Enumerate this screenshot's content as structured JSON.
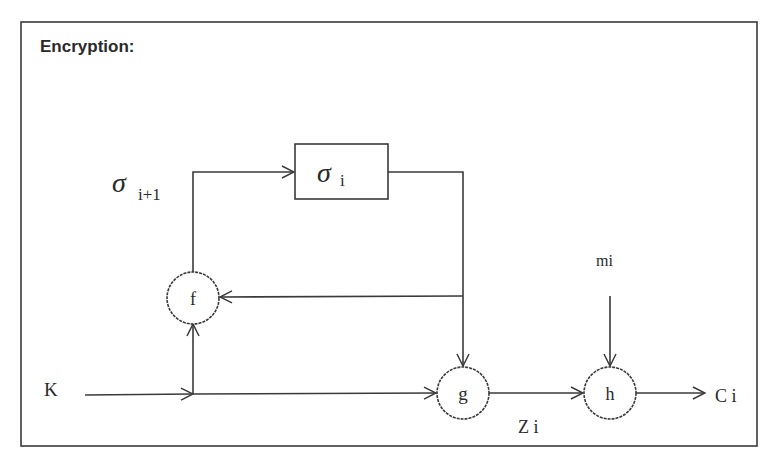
{
  "diagram": {
    "title": "Encryption:",
    "state_box": {
      "symbol": "σ",
      "subscript": "i"
    },
    "next_state_label": {
      "symbol": "σ",
      "subscript": "i+1"
    },
    "nodes": {
      "f": "f",
      "g": "g",
      "h": "h"
    },
    "inputs": {
      "key": "K",
      "message": "mi"
    },
    "signals": {
      "keystream": "Z i",
      "ciphertext": "C i"
    },
    "colors": {
      "stroke": "#3a3a3a",
      "text": "#2a2a2a",
      "background": "#ffffff"
    }
  }
}
